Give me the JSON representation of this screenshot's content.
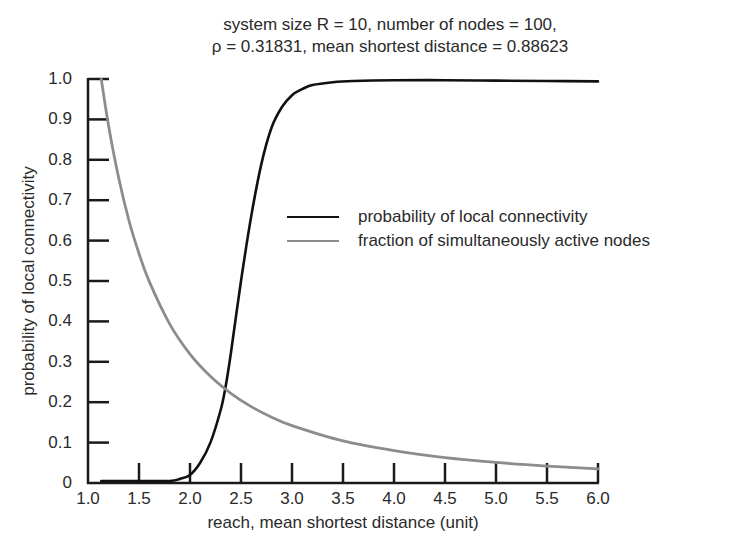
{
  "chart_data": {
    "type": "line",
    "title": "system size R = 10, number of nodes = 100,",
    "subtitle": "ρ = 0.31831, mean shortest distance = 0.88623",
    "xlabel": "reach, mean shortest distance (unit)",
    "ylabel": "probability of local connectivity",
    "xlim": [
      1.0,
      6.0
    ],
    "ylim": [
      0,
      1.0
    ],
    "grid": false,
    "legend_position": "center-right",
    "x_ticks": [
      "1.0",
      "1.5",
      "2.0",
      "2.5",
      "3.0",
      "3.5",
      "4.0",
      "4.5",
      "5.0",
      "5.5",
      "6.0"
    ],
    "y_ticks": [
      "0",
      "0.1",
      "0.2",
      "0.3",
      "0.4",
      "0.5",
      "0.6",
      "0.7",
      "0.8",
      "0.9",
      "1.0"
    ],
    "series": [
      {
        "name": "probability of local connectivity",
        "color": "#111111",
        "x": [
          1.13,
          1.5,
          1.8,
          1.9,
          2.0,
          2.1,
          2.2,
          2.3,
          2.35,
          2.4,
          2.5,
          2.6,
          2.7,
          2.8,
          2.9,
          3.0,
          3.1,
          3.2,
          3.4,
          3.6,
          4.0,
          4.5,
          5.0,
          5.5,
          6.0
        ],
        "values": [
          0.005,
          0.005,
          0.005,
          0.01,
          0.02,
          0.05,
          0.1,
          0.18,
          0.24,
          0.32,
          0.5,
          0.66,
          0.79,
          0.88,
          0.93,
          0.96,
          0.975,
          0.985,
          0.992,
          0.995,
          0.997,
          0.997,
          0.996,
          0.995,
          0.994
        ]
      },
      {
        "name": "fraction of simultaneously active nodes",
        "color": "#8c8c8c",
        "x": [
          1.13,
          1.2,
          1.3,
          1.4,
          1.5,
          1.6,
          1.8,
          2.0,
          2.2,
          2.4,
          2.6,
          2.8,
          3.0,
          3.5,
          4.0,
          4.5,
          5.0,
          5.5,
          6.0
        ],
        "values": [
          1.0,
          0.887,
          0.756,
          0.651,
          0.568,
          0.499,
          0.394,
          0.319,
          0.264,
          0.222,
          0.189,
          0.163,
          0.142,
          0.104,
          0.08,
          0.063,
          0.051,
          0.042,
          0.035
        ]
      }
    ]
  }
}
